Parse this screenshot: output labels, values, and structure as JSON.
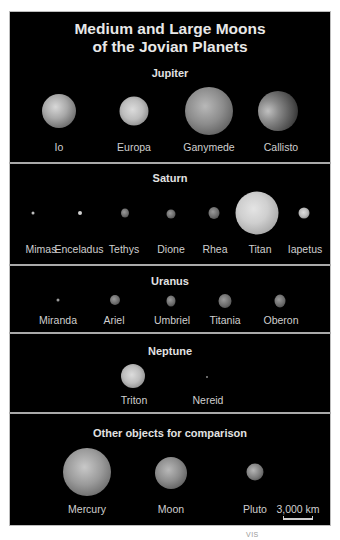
{
  "title": {
    "line1": "Medium and Large Moons",
    "line2": "of the Jovian Planets"
  },
  "sections": {
    "jupiter": {
      "heading": "Jupiter",
      "moons": [
        {
          "name": "Io"
        },
        {
          "name": "Europa"
        },
        {
          "name": "Ganymede"
        },
        {
          "name": "Callisto"
        }
      ]
    },
    "saturn": {
      "heading": "Saturn",
      "moons": [
        {
          "name": "Mimas"
        },
        {
          "name": "Enceladus"
        },
        {
          "name": "Tethys"
        },
        {
          "name": "Dione"
        },
        {
          "name": "Rhea"
        },
        {
          "name": "Titan"
        },
        {
          "name": "Iapetus"
        }
      ]
    },
    "uranus": {
      "heading": "Uranus",
      "moons": [
        {
          "name": "Miranda"
        },
        {
          "name": "Ariel"
        },
        {
          "name": "Umbriel"
        },
        {
          "name": "Titania"
        },
        {
          "name": "Oberon"
        }
      ]
    },
    "neptune": {
      "heading": "Neptune",
      "moons": [
        {
          "name": "Triton"
        },
        {
          "name": "Nereid"
        }
      ]
    },
    "comparison": {
      "heading": "Other objects for comparison",
      "objects": [
        {
          "name": "Mercury"
        },
        {
          "name": "Moon"
        },
        {
          "name": "Pluto"
        }
      ]
    }
  },
  "scale": {
    "label": "3,000 km"
  },
  "footnote": "VIS",
  "colors": {
    "background": "#000000",
    "divider": "#a9a9a9",
    "text": "#cfcfcf"
  }
}
